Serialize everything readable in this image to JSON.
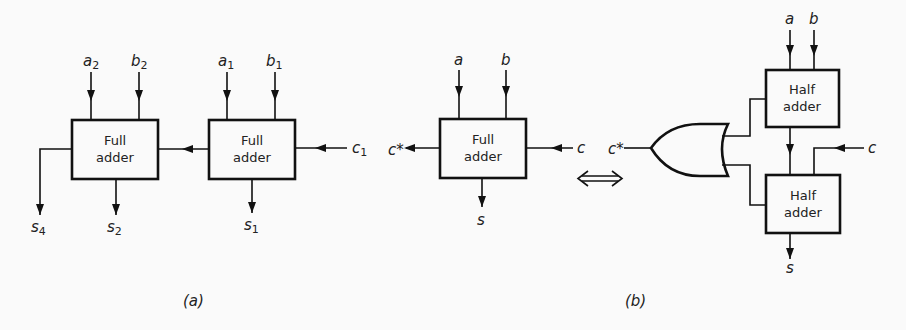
{
  "diagram": {
    "part_a": {
      "caption": "(a)",
      "full_adder_2": {
        "label_line1": "Full",
        "label_line2": "adder",
        "input_a": "a",
        "input_a_sub": "2",
        "input_b": "b",
        "input_b_sub": "2",
        "output_sum": "s",
        "output_sum_sub": "2",
        "output_carry": "s",
        "output_carry_sub": "4"
      },
      "full_adder_1": {
        "label_line1": "Full",
        "label_line2": "adder",
        "input_a": "a",
        "input_a_sub": "1",
        "input_b": "b",
        "input_b_sub": "1",
        "input_carry": "c",
        "input_carry_sub": "1",
        "output_sum": "s",
        "output_sum_sub": "1"
      }
    },
    "part_b": {
      "caption": "(b)",
      "full_adder": {
        "label_line1": "Full",
        "label_line2": "adder",
        "input_a": "a",
        "input_b": "b",
        "input_carry": "c",
        "output_sum": "s",
        "output_carry": "c*"
      },
      "equivalence_symbol": "⇔",
      "half_adder_top": {
        "label_line1": "Half",
        "label_line2": "adder",
        "input_a": "a",
        "input_b": "b"
      },
      "half_adder_bottom": {
        "label_line1": "Half",
        "label_line2": "adder",
        "input_carry": "c",
        "output_sum": "s"
      },
      "or_gate": {
        "output": "c*"
      }
    }
  }
}
